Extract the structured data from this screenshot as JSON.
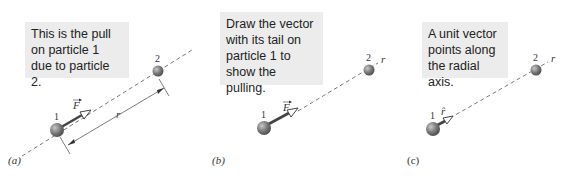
{
  "panels": [
    {
      "id": "a",
      "label": "(a)",
      "callout": "This is the pull on particle 1 due to particle 2.",
      "particle1_label": "1",
      "particle2_label": "2",
      "vector_label": "F",
      "distance_label": "r"
    },
    {
      "id": "b",
      "label": "(b)",
      "callout": "Draw the vector with its tail on particle 1 to show the pulling.",
      "particle1_label": "1",
      "particle2_label": "2",
      "vector_label": "F",
      "axis_label": "r"
    },
    {
      "id": "c",
      "label": "(c)",
      "callout": "A unit vector points along the radial axis.",
      "particle1_label": "1",
      "particle2_label": "2",
      "vector_label": "r̂",
      "axis_label": "r"
    }
  ],
  "colors": {
    "callout_bg": "#ececec",
    "particle": "#7a7a7a",
    "vector": "#444444",
    "dashed_line": "#555555"
  }
}
